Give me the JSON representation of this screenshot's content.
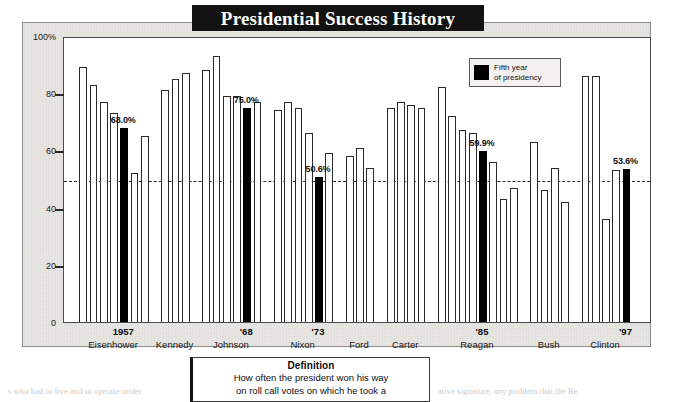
{
  "title": "Presidential Success History",
  "legend": {
    "swatch_color": "#000000",
    "label_line1": "Fifth year",
    "label_line2": "of presidency"
  },
  "definition": {
    "heading": "Definition",
    "line1": "How often the president won his way",
    "line2": "on roll call votes on which he took a"
  },
  "surrounding_text": {
    "bottom_left": "s who had to live and to operate under",
    "bottom_right": "ative signature, any problem that the Re"
  },
  "chart_data": {
    "type": "bar",
    "title": "Presidential Success History",
    "xlabel": "",
    "ylabel": "",
    "ylim": [
      0,
      100
    ],
    "yticks": [
      0,
      20,
      40,
      60,
      80,
      100
    ],
    "ytick_labels": [
      "0",
      "20",
      "40",
      "60",
      "80",
      "100%"
    ],
    "grid": false,
    "reference_line": 50,
    "legend_position": "top-right",
    "highlight_label": "Fifth year of presidency",
    "highlight_color": "#000000",
    "bar_color": "#ffffff",
    "bar_edge_color": "#2a2a2a",
    "presidents": [
      {
        "name": "Eisenhower",
        "year_label": "1957",
        "values": [
          89,
          83,
          77,
          73,
          68.0,
          52,
          65
        ],
        "fifth_year_index": 4,
        "fifth_year_value_label": "68.0%"
      },
      {
        "name": "Kennedy",
        "year_label": "",
        "values": [
          81,
          85,
          87
        ],
        "fifth_year_index": -1,
        "fifth_year_value_label": ""
      },
      {
        "name": "Johnson",
        "year_label": "'68",
        "values": [
          88,
          93,
          79,
          79,
          75.0,
          77
        ],
        "fifth_year_index": 4,
        "fifth_year_value_label": "75.0%"
      },
      {
        "name": "Nixon",
        "year_label": "'73",
        "values": [
          74,
          77,
          75,
          66,
          50.6,
          59
        ],
        "fifth_year_index": 4,
        "fifth_year_value_label": "50.6%"
      },
      {
        "name": "Ford",
        "year_label": "",
        "values": [
          58,
          61,
          54
        ],
        "fifth_year_index": -1,
        "fifth_year_value_label": ""
      },
      {
        "name": "Carter",
        "year_label": "",
        "values": [
          75,
          77,
          76,
          75
        ],
        "fifth_year_index": -1,
        "fifth_year_value_label": ""
      },
      {
        "name": "Reagan",
        "year_label": "'85",
        "values": [
          82,
          72,
          67,
          66,
          59.9,
          56,
          43,
          47
        ],
        "fifth_year_index": 4,
        "fifth_year_value_label": "59.9%"
      },
      {
        "name": "Bush",
        "year_label": "",
        "values": [
          63,
          46,
          54,
          42
        ],
        "fifth_year_index": -1,
        "fifth_year_value_label": ""
      },
      {
        "name": "Clinton",
        "year_label": "'97",
        "values": [
          86,
          86,
          36,
          53,
          53.6
        ],
        "fifth_year_index": 4,
        "fifth_year_value_label": "53.6%"
      }
    ]
  }
}
